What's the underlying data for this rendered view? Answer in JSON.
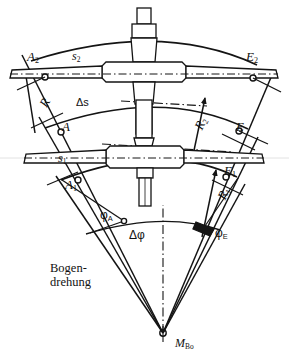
{
  "figure": {
    "title_text": "Bogendrehung",
    "caption_lines": [
      "Bogen-",
      "drehung"
    ],
    "domain": "technical-engineering-diagram",
    "background_color": "#ffffff",
    "ink_color": "#141414"
  },
  "labels": {
    "arc_start_outer": {
      "base": "A",
      "sub": "2",
      "x": 27,
      "y": 50
    },
    "arc_start_mid": {
      "base": "A",
      "sub": "",
      "x": 62,
      "y": 120
    },
    "arc_start_inner": {
      "base": "A",
      "sub": "1",
      "x": 65,
      "y": 178
    },
    "arc_end_outer": {
      "base": "E",
      "sub": "2",
      "x": 246,
      "y": 50
    },
    "arc_end_mid": {
      "base": "E",
      "sub": "",
      "x": 236,
      "y": 120
    },
    "arc_end_inner": {
      "base": "E",
      "sub": "1",
      "x": 224,
      "y": 164
    },
    "chord_outer": {
      "base": "s",
      "sub": "2",
      "x": 72,
      "y": 50
    },
    "chord_inner": {
      "base": "s",
      "sub": "1",
      "x": 58,
      "y": 152
    },
    "delta_s": {
      "text": "Δs",
      "x": 76,
      "y": 97
    },
    "delta_phi": {
      "text": "Δφ",
      "x": 129,
      "y": 229
    },
    "phi_a": {
      "base": "φ",
      "sub": "A",
      "x": 100,
      "y": 209
    },
    "phi_e": {
      "base": "φ",
      "sub": "E",
      "x": 215,
      "y": 227
    },
    "radius_left": {
      "base": "R",
      "sub": "",
      "x": 37,
      "y": 103
    },
    "radius_right_upper": {
      "base": "R",
      "sub": "2",
      "x": 192,
      "y": 126
    },
    "radius_right_lower": {
      "base": "R",
      "sub": "1",
      "x": 215,
      "y": 196
    },
    "center_point": {
      "base": "M",
      "sub": "Bo",
      "x": 175,
      "y": 337
    }
  },
  "geometry": {
    "center": {
      "x": 163,
      "y": 333
    },
    "radii": {
      "outer": 280,
      "mid": 215,
      "inner": 168
    },
    "angles_deg": {
      "start": -118,
      "end": -62
    },
    "marker_radius_px": 3
  },
  "annotations": {
    "centerline_style": "dash-dot",
    "arrow_count": 4,
    "marker_count": 6,
    "assembly_count": 2,
    "assembly_name": "wheelset-axle"
  }
}
